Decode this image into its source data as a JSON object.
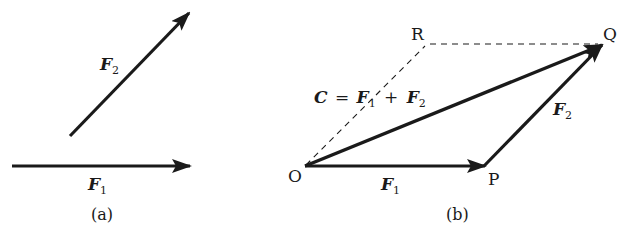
{
  "panels": [
    {
      "id": "a",
      "caption": "(a)",
      "vectors": [
        {
          "name": "F1",
          "symbol": "F",
          "subscript": "1",
          "from": [
            12,
            166
          ],
          "to": [
            191,
            166
          ]
        },
        {
          "name": "F2",
          "symbol": "F",
          "subscript": "2",
          "from": [
            70,
            136
          ],
          "to": [
            190,
            12
          ]
        }
      ]
    },
    {
      "id": "b",
      "caption": "(b)",
      "points": {
        "O": {
          "label": "O",
          "xy": [
            305,
            166
          ]
        },
        "P": {
          "label": "P",
          "xy": [
            486,
            166
          ]
        },
        "Q": {
          "label": "Q",
          "xy": [
            603,
            44
          ]
        },
        "R": {
          "label": "R",
          "xy": [
            425,
            44
          ]
        }
      },
      "vectors": [
        {
          "name": "F1",
          "symbol": "F",
          "subscript": "1",
          "from": "O",
          "to": "P"
        },
        {
          "name": "F2",
          "symbol": "F",
          "subscript": "2",
          "from": "P",
          "to": "Q"
        },
        {
          "name": "C",
          "symbol": "C",
          "from": "O",
          "to": "Q"
        }
      ],
      "dashed_lines": [
        [
          "O",
          "R"
        ],
        [
          "R",
          "Q"
        ]
      ],
      "resultant_equation": {
        "lhs": "C",
        "eq": "=",
        "t1": "F",
        "t1_sub": "1",
        "plus": "+",
        "t2": "F",
        "t2_sub": "2"
      }
    }
  ],
  "colors": {
    "stroke": "#1a1a1a",
    "background": "#ffffff"
  }
}
